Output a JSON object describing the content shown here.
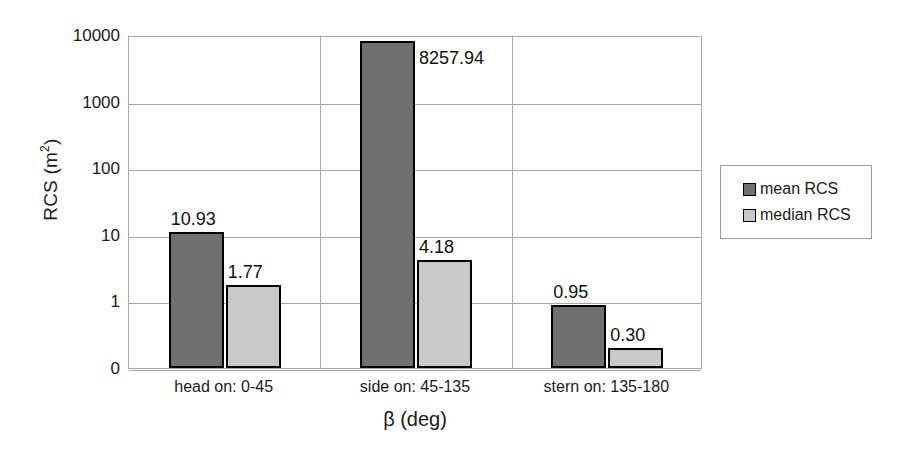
{
  "chart_data": {
    "type": "bar",
    "title": "",
    "xlabel": "β (deg)",
    "ylabel": "RCS (m²)",
    "ylabel_base": "RCS (m",
    "ylabel_sup": "2",
    "ylabel_close": ")",
    "yscale": "log",
    "ytick_labels": [
      "10000",
      "1000",
      "100",
      "10",
      "1",
      "0"
    ],
    "ytick_values": [
      10000,
      1000,
      100,
      10,
      1,
      0
    ],
    "ylim": [
      0,
      10000
    ],
    "grid": "horizontal-and-category-separators",
    "legend_position": "right",
    "categories": [
      "head on:  0-45",
      "side on: 45-135",
      "stern on: 135-180"
    ],
    "series": [
      {
        "name": "mean RCS",
        "color": "#707070",
        "values": [
          10.93,
          8257.94,
          0.95
        ],
        "labels": [
          "10.93",
          "8257.94",
          "0.95"
        ]
      },
      {
        "name": "median RCS",
        "color": "#c9c9c9",
        "values": [
          1.77,
          4.18,
          0.3
        ],
        "labels": [
          "1.77",
          "4.18",
          "0.30"
        ]
      }
    ]
  },
  "legend": {
    "items": [
      {
        "label": "mean RCS",
        "color": "#707070"
      },
      {
        "label": "median RCS",
        "color": "#c9c9c9"
      }
    ]
  },
  "colors": {
    "mean": "#707070",
    "median": "#c9c9c9",
    "grid": "#a8a8a8",
    "text": "#1a1a1a",
    "bar_border": "#000000",
    "background": "#ffffff"
  }
}
